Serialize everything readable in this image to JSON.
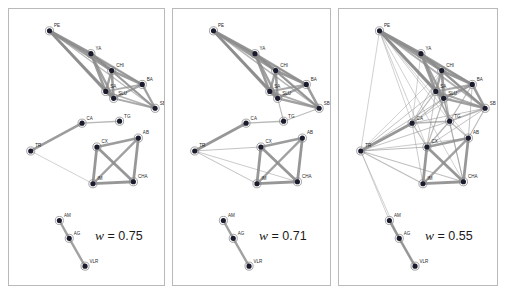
{
  "figure": {
    "title": "",
    "background": "#ffffff",
    "panel_border_color": "#b9b9b9",
    "node_fill": "#1b1b2e",
    "node_ring": "#8a8a8a",
    "edge_color": "#8c8c8c"
  },
  "panels": [
    {
      "id": "panel-0",
      "weight_prefix": "w",
      "weight_eq": "=",
      "weight_value": "0.75",
      "weight_label": "w = 0.75",
      "weight_pos": {
        "x": 86,
        "y": 219
      }
    },
    {
      "id": "panel-1",
      "weight_prefix": "w",
      "weight_eq": "=",
      "weight_value": "0.71",
      "weight_label": "w = 0.71",
      "weight_pos": {
        "x": 86,
        "y": 219
      }
    },
    {
      "id": "panel-2",
      "weight_prefix": "w",
      "weight_eq": "=",
      "weight_value": "0.55",
      "weight_label": "w = 0.55",
      "weight_pos": {
        "x": 86,
        "y": 219
      }
    }
  ],
  "chart_data": {
    "type": "scatter",
    "title": "",
    "xlabel": "",
    "ylabel": "",
    "node_labels": [
      "PE",
      "YA",
      "CHI",
      "BA",
      "SA",
      "SLU",
      "SB",
      "CA",
      "TG",
      "TR",
      "CX",
      "AB",
      "CHA",
      "IM",
      "AM",
      "AG",
      "VLR"
    ],
    "nodes": [
      {
        "id": "PE",
        "label": "PE",
        "x": 41,
        "y": 22
      },
      {
        "id": "YA",
        "label": "YA",
        "x": 83,
        "y": 45
      },
      {
        "id": "CHI",
        "label": "CHI",
        "x": 104,
        "y": 62
      },
      {
        "id": "BA",
        "label": "BA",
        "x": 135,
        "y": 76
      },
      {
        "id": "SA",
        "label": "SA",
        "x": 98,
        "y": 83
      },
      {
        "id": "SLU",
        "label": "SLU",
        "x": 106,
        "y": 90
      },
      {
        "id": "SB",
        "label": "SB",
        "x": 148,
        "y": 100
      },
      {
        "id": "CA",
        "label": "CA",
        "x": 74,
        "y": 115
      },
      {
        "id": "TG",
        "label": "TG",
        "x": 112,
        "y": 113
      },
      {
        "id": "TR",
        "label": "TR",
        "x": 22,
        "y": 143
      },
      {
        "id": "CX",
        "label": "CX",
        "x": 89,
        "y": 139
      },
      {
        "id": "AB",
        "label": "AB",
        "x": 131,
        "y": 130
      },
      {
        "id": "CHA",
        "label": "CHA",
        "x": 126,
        "y": 174
      },
      {
        "id": "IM",
        "label": "IM",
        "x": 85,
        "y": 176
      },
      {
        "id": "AM",
        "label": "AM",
        "x": 51,
        "y": 213
      },
      {
        "id": "AG",
        "label": "AG",
        "x": 61,
        "y": 231
      },
      {
        "id": "VLR",
        "label": "VLR",
        "x": 77,
        "y": 259
      }
    ],
    "series": [
      {
        "name": "w = 0.75",
        "panel": 0,
        "edges": [
          [
            "PE",
            "YA",
            3.2
          ],
          [
            "PE",
            "CHI",
            2.6
          ],
          [
            "PE",
            "SA",
            2.8
          ],
          [
            "PE",
            "SLU",
            2.6
          ],
          [
            "PE",
            "BA",
            1.6
          ],
          [
            "PE",
            "SB",
            1.3
          ],
          [
            "YA",
            "CHI",
            3.0
          ],
          [
            "YA",
            "SA",
            2.6
          ],
          [
            "YA",
            "SLU",
            2.4
          ],
          [
            "YA",
            "BA",
            2.0
          ],
          [
            "YA",
            "SB",
            1.5
          ],
          [
            "CHI",
            "BA",
            2.6
          ],
          [
            "CHI",
            "SA",
            2.4
          ],
          [
            "CHI",
            "SLU",
            2.6
          ],
          [
            "CHI",
            "SB",
            2.0
          ],
          [
            "BA",
            "SLU",
            2.2
          ],
          [
            "BA",
            "SA",
            1.8
          ],
          [
            "BA",
            "SB",
            2.4
          ],
          [
            "SA",
            "SLU",
            3.0
          ],
          [
            "SA",
            "SB",
            1.6
          ],
          [
            "SLU",
            "SB",
            2.0
          ],
          [
            "CA",
            "TG",
            1.4
          ],
          [
            "CA",
            "TR",
            2.6
          ],
          [
            "TR",
            "IM",
            0.8
          ],
          [
            "CX",
            "AB",
            2.6
          ],
          [
            "CX",
            "CHA",
            2.8
          ],
          [
            "CX",
            "IM",
            2.8
          ],
          [
            "AB",
            "CHA",
            2.8
          ],
          [
            "AB",
            "IM",
            2.4
          ],
          [
            "CHA",
            "IM",
            2.8
          ],
          [
            "AM",
            "AG",
            2.4
          ],
          [
            "AG",
            "VLR",
            2.4
          ]
        ]
      },
      {
        "name": "w = 0.71",
        "panel": 1,
        "edges": [
          [
            "PE",
            "YA",
            3.2
          ],
          [
            "PE",
            "CHI",
            2.6
          ],
          [
            "PE",
            "SA",
            2.8
          ],
          [
            "PE",
            "SLU",
            2.6
          ],
          [
            "PE",
            "BA",
            1.8
          ],
          [
            "PE",
            "SB",
            1.5
          ],
          [
            "YA",
            "CHI",
            3.0
          ],
          [
            "YA",
            "SA",
            2.6
          ],
          [
            "YA",
            "SLU",
            2.4
          ],
          [
            "YA",
            "BA",
            2.2
          ],
          [
            "YA",
            "SB",
            1.6
          ],
          [
            "CHI",
            "BA",
            2.8
          ],
          [
            "CHI",
            "SA",
            2.4
          ],
          [
            "CHI",
            "SLU",
            2.6
          ],
          [
            "CHI",
            "SB",
            2.2
          ],
          [
            "BA",
            "SLU",
            2.4
          ],
          [
            "BA",
            "SA",
            2.0
          ],
          [
            "BA",
            "SB",
            2.6
          ],
          [
            "SA",
            "SLU",
            3.0
          ],
          [
            "SA",
            "SB",
            1.8
          ],
          [
            "SLU",
            "SB",
            2.4
          ],
          [
            "SLU",
            "TG",
            1.2
          ],
          [
            "SB",
            "TG",
            1.2
          ],
          [
            "CA",
            "TG",
            1.4
          ],
          [
            "CA",
            "TR",
            2.8
          ],
          [
            "TR",
            "IM",
            1.0
          ],
          [
            "TR",
            "CX",
            1.0
          ],
          [
            "TR",
            "CHA",
            0.9
          ],
          [
            "CX",
            "AB",
            2.6
          ],
          [
            "CX",
            "CHA",
            2.8
          ],
          [
            "CX",
            "IM",
            2.8
          ],
          [
            "AB",
            "CHA",
            2.8
          ],
          [
            "AB",
            "IM",
            2.4
          ],
          [
            "CHA",
            "IM",
            2.8
          ],
          [
            "AM",
            "AG",
            2.4
          ],
          [
            "AG",
            "VLR",
            2.4
          ]
        ]
      },
      {
        "name": "w = 0.55",
        "panel": 2,
        "edges": [
          [
            "PE",
            "YA",
            3.2
          ],
          [
            "PE",
            "CHI",
            2.6
          ],
          [
            "PE",
            "SA",
            2.8
          ],
          [
            "PE",
            "SLU",
            2.6
          ],
          [
            "PE",
            "BA",
            2.0
          ],
          [
            "PE",
            "SB",
            1.8
          ],
          [
            "PE",
            "TR",
            0.8
          ],
          [
            "PE",
            "CA",
            0.8
          ],
          [
            "PE",
            "CX",
            0.8
          ],
          [
            "PE",
            "TG",
            0.8
          ],
          [
            "PE",
            "AB",
            0.8
          ],
          [
            "PE",
            "CHA",
            0.8
          ],
          [
            "YA",
            "CHI",
            3.0
          ],
          [
            "YA",
            "SA",
            2.6
          ],
          [
            "YA",
            "SLU",
            2.4
          ],
          [
            "YA",
            "BA",
            2.4
          ],
          [
            "YA",
            "SB",
            1.8
          ],
          [
            "YA",
            "TG",
            1.0
          ],
          [
            "YA",
            "CA",
            0.8
          ],
          [
            "CHI",
            "BA",
            2.8
          ],
          [
            "CHI",
            "SA",
            2.4
          ],
          [
            "CHI",
            "SLU",
            2.6
          ],
          [
            "CHI",
            "SB",
            2.4
          ],
          [
            "CHI",
            "TG",
            1.2
          ],
          [
            "CHI",
            "CA",
            1.0
          ],
          [
            "CHI",
            "TR",
            0.8
          ],
          [
            "BA",
            "SLU",
            2.4
          ],
          [
            "BA",
            "SA",
            2.0
          ],
          [
            "BA",
            "SB",
            2.6
          ],
          [
            "BA",
            "TG",
            1.2
          ],
          [
            "BA",
            "AB",
            1.0
          ],
          [
            "BA",
            "CA",
            0.9
          ],
          [
            "SA",
            "SLU",
            3.0
          ],
          [
            "SA",
            "SB",
            2.0
          ],
          [
            "SA",
            "TG",
            1.4
          ],
          [
            "SA",
            "CA",
            1.2
          ],
          [
            "SA",
            "TR",
            1.0
          ],
          [
            "SA",
            "CX",
            1.0
          ],
          [
            "SLU",
            "SB",
            2.4
          ],
          [
            "SLU",
            "TG",
            1.6
          ],
          [
            "SLU",
            "CA",
            1.2
          ],
          [
            "SLU",
            "TR",
            1.0
          ],
          [
            "SLU",
            "CX",
            1.2
          ],
          [
            "SLU",
            "CHA",
            1.0
          ],
          [
            "SB",
            "TG",
            1.6
          ],
          [
            "SB",
            "AB",
            1.2
          ],
          [
            "SB",
            "CA",
            1.0
          ],
          [
            "SB",
            "CX",
            1.0
          ],
          [
            "CA",
            "TG",
            1.6
          ],
          [
            "CA",
            "TR",
            2.8
          ],
          [
            "CA",
            "CX",
            1.2
          ],
          [
            "CA",
            "IM",
            0.9
          ],
          [
            "TG",
            "CX",
            1.4
          ],
          [
            "TG",
            "AB",
            1.2
          ],
          [
            "TG",
            "CHA",
            1.0
          ],
          [
            "TG",
            "TR",
            1.0
          ],
          [
            "TR",
            "IM",
            1.2
          ],
          [
            "TR",
            "CX",
            1.2
          ],
          [
            "TR",
            "CHA",
            1.1
          ],
          [
            "TR",
            "AB",
            0.9
          ],
          [
            "TR",
            "AM",
            0.8
          ],
          [
            "TR",
            "AG",
            0.8
          ],
          [
            "CX",
            "AB",
            2.6
          ],
          [
            "CX",
            "CHA",
            2.8
          ],
          [
            "CX",
            "IM",
            2.8
          ],
          [
            "AB",
            "CHA",
            2.8
          ],
          [
            "AB",
            "IM",
            2.4
          ],
          [
            "CHA",
            "IM",
            2.8
          ],
          [
            "AM",
            "AG",
            2.6
          ],
          [
            "AG",
            "VLR",
            2.6
          ],
          [
            "AM",
            "VLR",
            1.0
          ]
        ]
      }
    ],
    "legend_position": "inside-bottom-right",
    "grid": false
  }
}
